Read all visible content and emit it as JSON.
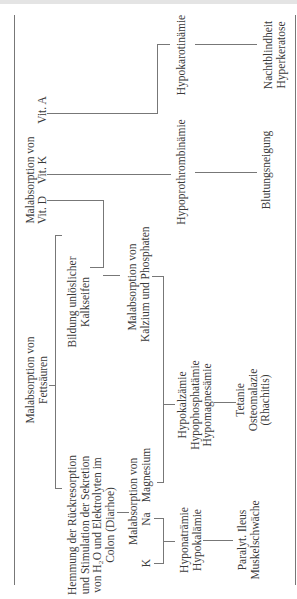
{
  "diagram": {
    "orientation": "rotated -90deg",
    "nodes": {
      "fettsaeuren": {
        "line1": "Malabsorption von",
        "line2": "Fettsäuren"
      },
      "kalkseifen": {
        "line1": "Bildung unlöslicher",
        "line2": "Kalkseifen"
      },
      "hemmung": {
        "line1": "Hemmung der Rückresorption",
        "line2": "und Stimulation der Sekretion",
        "line3": "von H₂O und Elektrolyten im",
        "line4": "Colon (Diarhoe)"
      },
      "vitamine": {
        "header": "Malabsorption von",
        "vit_d": "Vit. D",
        "vit_k": "Vit. K",
        "vit_a": "Vit. A"
      },
      "kalzium": {
        "line1": "Malabsorption von",
        "line2": "Kalzium und Phosphaten"
      },
      "elektrolyte": {
        "header": "Malabsorption von",
        "k": "K",
        "na": "Na",
        "mg": "Magnesium"
      },
      "hypo_ca": {
        "line1": "Hypokalzämie",
        "line2": "Hypophosphatämie",
        "line3": "Hypomagnesämie"
      },
      "tetanie": {
        "line1": "Tetanie",
        "line2": "Osteomalazie",
        "line3": "(Rhachitis)"
      },
      "hypo_na": {
        "line1": "Hyponaträmie",
        "line2": "Hypokalämie"
      },
      "ileus": {
        "line1": "Paralyt. Ileus",
        "line2": "Muskelschwäche"
      },
      "hypoprothrombin": {
        "label": "Hypoprothrombinämie"
      },
      "blutung": {
        "label": "Blutungsneigung"
      },
      "hypokarotin": {
        "label": "Hypokarotinämie"
      },
      "nachtblind": {
        "line1": "Nachtblindheit",
        "line2": "Hyperkeratose"
      }
    }
  }
}
